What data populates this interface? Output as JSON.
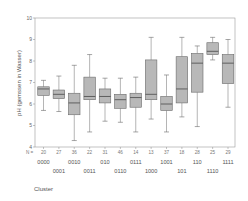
{
  "chart_data": {
    "type": "boxplot",
    "title": "",
    "xlabel": "Cluster",
    "ylabel": "pH (gemssen in Wasser)",
    "ylim": [
      4,
      10
    ],
    "yticks": [
      4,
      5,
      6,
      7,
      8,
      9,
      10
    ],
    "n_prefix": "N =",
    "categories": [
      "0000",
      "0001",
      "0010",
      "0011",
      "010",
      "0110",
      "0111",
      "1000",
      "1001",
      "101",
      "110",
      "1110",
      "1111"
    ],
    "n": [
      20,
      27,
      36,
      22,
      31,
      46,
      14,
      13,
      37,
      18,
      28,
      25,
      29
    ],
    "boxes": [
      {
        "whisker_low": 5.7,
        "q1": 6.4,
        "median": 6.7,
        "q3": 6.8,
        "whisker_high": 7.1
      },
      {
        "whisker_low": 5.65,
        "q1": 6.25,
        "median": 6.45,
        "q3": 6.65,
        "whisker_high": 7.3
      },
      {
        "whisker_low": 4.3,
        "q1": 5.5,
        "median": 6.05,
        "q3": 6.5,
        "whisker_high": 7.8
      },
      {
        "whisker_low": 4.7,
        "q1": 6.2,
        "median": 6.35,
        "q3": 7.25,
        "whisker_high": 8.3
      },
      {
        "whisker_low": 5.2,
        "q1": 6.05,
        "median": 6.35,
        "q3": 6.7,
        "whisker_high": 7.2
      },
      {
        "whisker_low": 5.15,
        "q1": 5.8,
        "median": 6.2,
        "q3": 6.45,
        "whisker_high": 7.2
      },
      {
        "whisker_low": 4.7,
        "q1": 5.85,
        "median": 6.3,
        "q3": 6.5,
        "whisker_high": 7.25
      },
      {
        "whisker_low": 5.3,
        "q1": 6.2,
        "median": 6.45,
        "q3": 8.05,
        "whisker_high": 9.1
      },
      {
        "whisker_low": 4.7,
        "q1": 5.7,
        "median": 6.0,
        "q3": 6.35,
        "whisker_high": 7.35
      },
      {
        "whisker_low": 5.4,
        "q1": 6.05,
        "median": 6.7,
        "q3": 8.2,
        "whisker_high": 9.1
      },
      {
        "whisker_low": 4.95,
        "q1": 6.55,
        "median": 7.9,
        "q3": 8.35,
        "whisker_high": 8.7
      },
      {
        "whisker_low": 8.05,
        "q1": 8.3,
        "median": 8.45,
        "q3": 8.85,
        "whisker_high": 9.1
      },
      {
        "whisker_low": 5.85,
        "q1": 6.95,
        "median": 7.9,
        "q3": 8.3,
        "whisker_high": 9.0
      }
    ],
    "colors": {
      "box_fill": "#b8b8b8",
      "box_stroke": "#6a6a6a",
      "median": "#555555",
      "axis": "#888888",
      "frame": "#999999"
    }
  }
}
